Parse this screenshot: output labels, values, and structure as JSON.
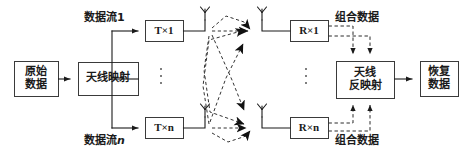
{
  "diagram": {
    "colors": {
      "line": "#1a1a1a",
      "box_stroke": "#3a3a3a",
      "box_fill": "#ffffff",
      "dashed": "#3a3a3a",
      "background": "#ffffff"
    },
    "blocks": [
      {
        "id": "source-data",
        "lines": [
          "原始",
          "数据"
        ],
        "x": 14,
        "y": 61,
        "w": 44,
        "h": 35
      },
      {
        "id": "antenna-mapping",
        "lines": [
          "天线映射"
        ],
        "x": 78,
        "y": 62,
        "w": 60,
        "h": 33
      },
      {
        "id": "tx-1",
        "lines": [
          "T×1"
        ],
        "x": 145,
        "y": 20,
        "w": 38,
        "h": 21
      },
      {
        "id": "tx-n",
        "lines": [
          "T×n"
        ],
        "x": 145,
        "y": 117,
        "w": 38,
        "h": 21
      },
      {
        "id": "rx-1",
        "lines": [
          "R×1"
        ],
        "x": 290,
        "y": 20,
        "w": 38,
        "h": 21
      },
      {
        "id": "rx-n",
        "lines": [
          "R×n"
        ],
        "x": 290,
        "y": 117,
        "w": 38,
        "h": 21
      },
      {
        "id": "antenna-demapping",
        "lines": [
          "天线",
          "反映射"
        ],
        "x": 336,
        "y": 61,
        "w": 58,
        "h": 37
      },
      {
        "id": "recovered-data",
        "lines": [
          "恢复",
          "数据"
        ],
        "x": 420,
        "y": 61,
        "w": 38,
        "h": 35
      }
    ],
    "labels": [
      {
        "id": "data-stream-1",
        "text": "数据流1",
        "x": 84,
        "y": 8,
        "italic_tail": ""
      },
      {
        "id": "data-stream-n",
        "text": "数据流",
        "x": 84,
        "y": 131,
        "italic_tail": "n"
      },
      {
        "id": "combined-data-top",
        "text": "组合数据",
        "x": 335,
        "y": 8,
        "italic_tail": ""
      },
      {
        "id": "combined-data-bot",
        "text": "组合数据",
        "x": 335,
        "y": 131,
        "italic_tail": ""
      }
    ],
    "antennas": [
      {
        "id": "tx-antenna-1",
        "x": 205,
        "y": 12,
        "side": "tx"
      },
      {
        "id": "tx-antenna-n",
        "x": 205,
        "y": 109,
        "side": "tx"
      },
      {
        "id": "rx-antenna-1",
        "x": 262,
        "y": 12,
        "side": "rx"
      },
      {
        "id": "rx-antenna-n",
        "x": 262,
        "y": 109,
        "side": "rx"
      }
    ],
    "ellipses": [
      {
        "id": "tx-ellipsis",
        "x": 160,
        "y": 68
      },
      {
        "id": "rx-ellipsis",
        "x": 305,
        "y": 68
      }
    ],
    "channel": {
      "description": "dashed multipath arrows between transmit and receive antennas",
      "paths": 4
    }
  }
}
